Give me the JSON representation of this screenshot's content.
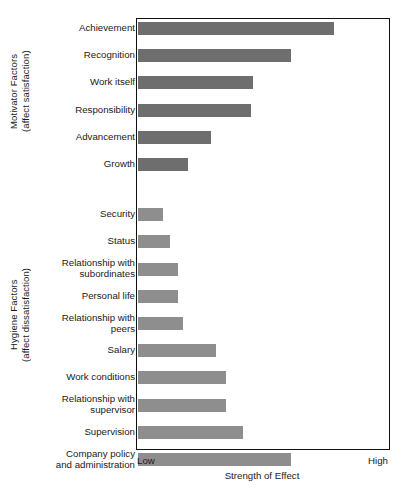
{
  "chart_data": {
    "type": "bar",
    "orientation": "horizontal",
    "title": "",
    "xlabel": "Strength of Effect",
    "ylabel": "",
    "xlim": [
      0,
      100
    ],
    "grid": false,
    "legend": null,
    "x_tick_labels": [
      "Low",
      "High"
    ],
    "axis_low_label": "Low",
    "axis_high_label": "High",
    "groups": [
      {
        "name": "motivator",
        "group_label": "Motivator Factors\n(affect satisfaction)",
        "color": "#6e6e6e",
        "categories": [
          "Achievement",
          "Recognition",
          "Work itself",
          "Responsibility",
          "Advancement",
          "Growth"
        ],
        "values": [
          78,
          61,
          46,
          45,
          29,
          20
        ]
      },
      {
        "name": "hygiene",
        "group_label": "Hygiene Factors\n(affect dissatisfaction)",
        "color": "#8e8e8e",
        "categories": [
          "Security",
          "Status",
          "Relationship with\nsubordinates",
          "Personal life",
          "Relationship with\npeers",
          "Salary",
          "Work conditions",
          "Relationship with\nsupervisor",
          "Supervision",
          "Company policy\nand administration"
        ],
        "values": [
          10,
          13,
          16,
          16,
          18,
          31,
          35,
          35,
          42,
          61
        ]
      }
    ],
    "categories": [
      "Achievement",
      "Recognition",
      "Work itself",
      "Responsibility",
      "Advancement",
      "Growth",
      "Security",
      "Status",
      "Relationship with subordinates",
      "Personal life",
      "Relationship with peers",
      "Salary",
      "Work conditions",
      "Relationship with supervisor",
      "Supervision",
      "Company policy and administration"
    ],
    "values": [
      78,
      61,
      46,
      45,
      29,
      20,
      10,
      13,
      16,
      16,
      18,
      31,
      35,
      35,
      42,
      61
    ]
  },
  "colors": {
    "motivator_bar": "#6e6e6e",
    "hygiene_bar": "#8e8e8e",
    "frame": "#111111",
    "text": "#1a1a1a",
    "background": "#ffffff"
  }
}
